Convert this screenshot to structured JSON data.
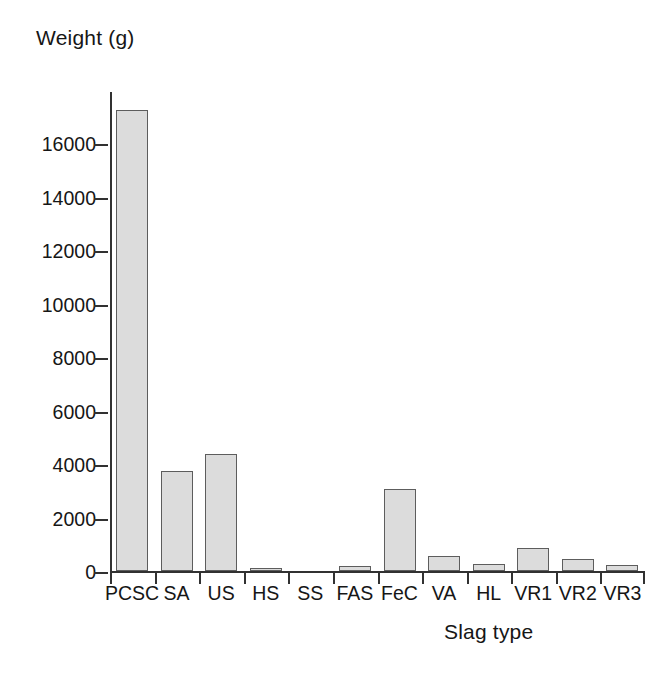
{
  "chart_data": {
    "type": "bar",
    "title": "",
    "xlabel": "Slag type",
    "ylabel": "Weight (g)",
    "categories": [
      "PCSC",
      "SA",
      "US",
      "HS",
      "SS",
      "FAS",
      "FeC",
      "VA",
      "HL",
      "VR1",
      "VR2",
      "VR3"
    ],
    "values": [
      17250,
      3750,
      4380,
      120,
      0,
      180,
      3080,
      570,
      280,
      870,
      460,
      240
    ],
    "series": [
      {
        "name": "Weight (g)",
        "values": [
          17250,
          3750,
          4380,
          120,
          0,
          180,
          3080,
          570,
          280,
          870,
          460,
          240
        ]
      }
    ],
    "ylim": [
      0,
      18000
    ],
    "yticks": [
      0,
      2000,
      4000,
      6000,
      8000,
      10000,
      12000,
      14000,
      16000
    ],
    "ytick_labels": [
      "0",
      "2000",
      "4000",
      "6000",
      "8000",
      "10000",
      "12000",
      "14000",
      "16000"
    ],
    "grid": false,
    "legend": false,
    "legend_position": "none",
    "bar_fill_color": "#dcdcdc",
    "bar_edge_color": "#5d5d5d",
    "axis_color": "#313131",
    "background_color": "#ffffff"
  },
  "axes": {
    "y_title": "Weight (g)",
    "x_title": "Slag type"
  }
}
